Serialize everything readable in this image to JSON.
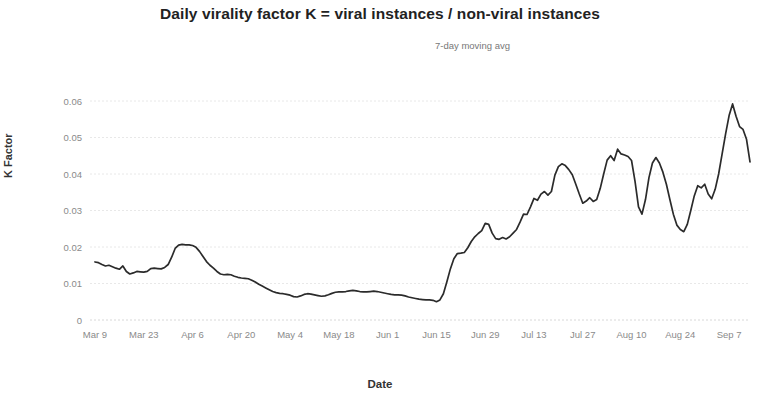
{
  "chart_data": {
    "type": "line",
    "title": "Daily virality factor K = viral instances / non-viral instances",
    "subtitle": "7-day moving avg",
    "xlabel": "Date",
    "ylabel": "K Factor",
    "grid": true,
    "legend": false,
    "ylim": [
      0,
      0.062
    ],
    "ytick_labels": [
      "0",
      "0.01",
      "0.02",
      "0.03",
      "0.04",
      "0.05",
      "0.06"
    ],
    "ytick_values": [
      0,
      0.01,
      0.02,
      0.03,
      0.04,
      0.05,
      0.06
    ],
    "xtick_labels": [
      "Mar 9",
      "Mar 23",
      "Apr 6",
      "Apr 20",
      "May 4",
      "May 18",
      "Jun 1",
      "Jun 15",
      "Jun 29",
      "Jul 13",
      "Jul 27",
      "Aug 10",
      "Aug 24",
      "Sep 7"
    ],
    "xtick_indices": [
      0,
      14,
      28,
      42,
      56,
      70,
      84,
      98,
      112,
      126,
      140,
      154,
      168,
      182
    ],
    "series": [
      {
        "name": "K Factor (7-day moving avg)",
        "color": "#2b2b2b",
        "values": [
          0.0159,
          0.0157,
          0.0152,
          0.0148,
          0.015,
          0.0146,
          0.0142,
          0.0139,
          0.0148,
          0.0133,
          0.0126,
          0.0129,
          0.0133,
          0.0132,
          0.0131,
          0.0133,
          0.0141,
          0.0142,
          0.0141,
          0.014,
          0.0144,
          0.0152,
          0.0172,
          0.0196,
          0.0205,
          0.0207,
          0.0206,
          0.0206,
          0.0204,
          0.0199,
          0.0188,
          0.0174,
          0.016,
          0.015,
          0.0142,
          0.0133,
          0.0126,
          0.0124,
          0.0125,
          0.0124,
          0.012,
          0.0117,
          0.0115,
          0.0114,
          0.0113,
          0.0109,
          0.0104,
          0.0098,
          0.0093,
          0.0088,
          0.0083,
          0.0078,
          0.0075,
          0.0073,
          0.0072,
          0.007,
          0.0068,
          0.0064,
          0.0063,
          0.0066,
          0.007,
          0.0072,
          0.0071,
          0.0069,
          0.0067,
          0.0065,
          0.0066,
          0.0069,
          0.0073,
          0.0076,
          0.0077,
          0.0077,
          0.0078,
          0.008,
          0.0081,
          0.008,
          0.0078,
          0.0077,
          0.0077,
          0.0078,
          0.0079,
          0.0078,
          0.0076,
          0.0074,
          0.0072,
          0.007,
          0.0069,
          0.0069,
          0.0068,
          0.0066,
          0.0063,
          0.0061,
          0.0059,
          0.0057,
          0.0056,
          0.0055,
          0.0055,
          0.0054,
          0.005,
          0.0055,
          0.0072,
          0.0105,
          0.014,
          0.0168,
          0.0182,
          0.0183,
          0.0185,
          0.0198,
          0.0215,
          0.0228,
          0.0237,
          0.0245,
          0.0265,
          0.0262,
          0.0238,
          0.0223,
          0.0221,
          0.0226,
          0.0222,
          0.0228,
          0.0238,
          0.0248,
          0.0268,
          0.029,
          0.0289,
          0.031,
          0.0333,
          0.0328,
          0.0345,
          0.0352,
          0.0342,
          0.0352,
          0.0397,
          0.042,
          0.0428,
          0.0423,
          0.0412,
          0.0398,
          0.0372,
          0.0345,
          0.032,
          0.0326,
          0.0335,
          0.0325,
          0.033,
          0.036,
          0.04,
          0.0438,
          0.045,
          0.0437,
          0.0468,
          0.0455,
          0.0452,
          0.0448,
          0.0437,
          0.038,
          0.031,
          0.029,
          0.033,
          0.039,
          0.043,
          0.0445,
          0.043,
          0.0405,
          0.0372,
          0.033,
          0.029,
          0.026,
          0.0248,
          0.0242,
          0.0262,
          0.03,
          0.034,
          0.0368,
          0.0362,
          0.0372,
          0.0345,
          0.0332,
          0.0358,
          0.04,
          0.0455,
          0.051,
          0.056,
          0.0592,
          0.0558,
          0.053,
          0.0522,
          0.0495,
          0.0433
        ]
      }
    ]
  }
}
